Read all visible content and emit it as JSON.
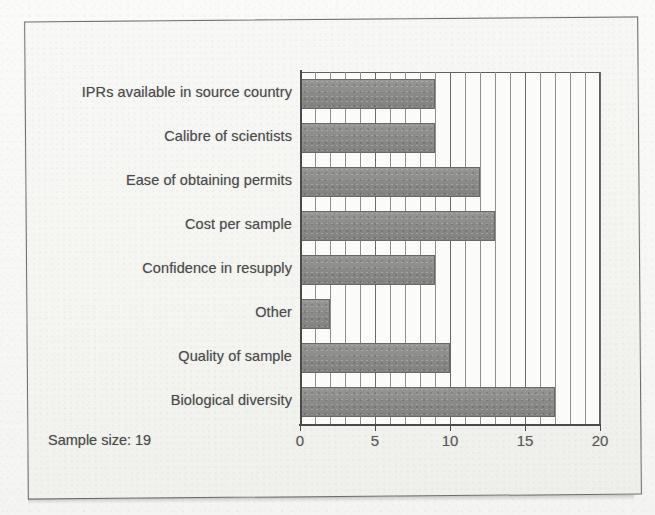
{
  "chart_data": {
    "type": "bar",
    "orientation": "horizontal",
    "title": "",
    "xlabel": "",
    "ylabel": "",
    "categories": [
      "IPRs available in source country",
      "Calibre of scientists",
      "Ease of obtaining permits",
      "Cost per sample",
      "Confidence in resupply",
      "Other",
      "Quality of sample",
      "Biological diversity"
    ],
    "values": [
      9,
      9,
      12,
      13,
      9,
      2,
      10,
      17
    ],
    "xlim": [
      0,
      20
    ],
    "xticks": [
      0,
      5,
      10,
      15,
      20
    ],
    "xtick_labels": [
      "0",
      "5",
      "10",
      "15",
      "20"
    ],
    "minor_gridline_interval": 1,
    "grid": true,
    "legend": false,
    "bar_color": "#8a8a88",
    "plot_background": "#fbfbf9",
    "axis_color": "#4a4a4a",
    "annotations": [
      {
        "name": "sample-size-note",
        "text": "Sample size: 19"
      }
    ]
  },
  "figure": {
    "note_label": "Sample size: 19",
    "frame_color": "#6d6d6d",
    "paper_color": "#f5f5f2"
  }
}
